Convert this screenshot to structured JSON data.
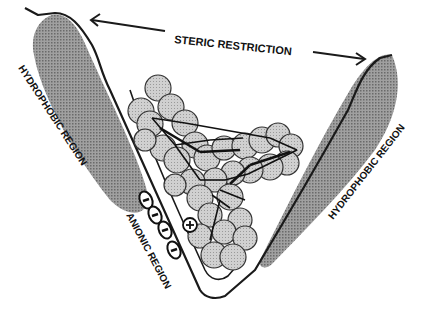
{
  "diagram": {
    "labels": {
      "top": "STERIC RESTRICTION",
      "left_region": "HYDROPHOBIC REGION",
      "right_region": "HYDROPHOBIC REGION",
      "anionic_region": "ANIONIC REGION"
    },
    "charges": {
      "anionic_symbol": "−",
      "anionic_count": 4,
      "cationic_symbol": "+"
    },
    "colors": {
      "stroke": "#1a1a1a",
      "hydrophobic_fill": "#8e8e8e",
      "atom_fill": "#c4c4c4",
      "background": "#ffffff"
    }
  }
}
